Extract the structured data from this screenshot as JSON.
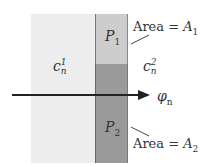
{
  "diagram": {
    "regions": [
      {
        "id": "cell-1",
        "label_base": "c",
        "label_sub": "n",
        "label_sup": "1",
        "fill": "#ededed"
      },
      {
        "id": "cell-2",
        "label_base": "c",
        "label_sub": "n",
        "label_sup": "2",
        "fill": "#ffffff"
      },
      {
        "id": "P1",
        "label_base": "P",
        "label_sub": "1",
        "fill": "#cdcdcd"
      },
      {
        "id": "P2",
        "label_base": "P",
        "label_sub": "2",
        "fill": "#9a9a9a"
      }
    ],
    "annotations": [
      {
        "id": "area-1",
        "text_prefix": "Area = ",
        "var": "A",
        "sub": "1"
      },
      {
        "id": "area-2",
        "text_prefix": "Area = ",
        "var": "A",
        "sub": "2"
      }
    ],
    "arrow": {
      "label_base": "φ",
      "label_sub": "n",
      "color": "#222222"
    }
  }
}
